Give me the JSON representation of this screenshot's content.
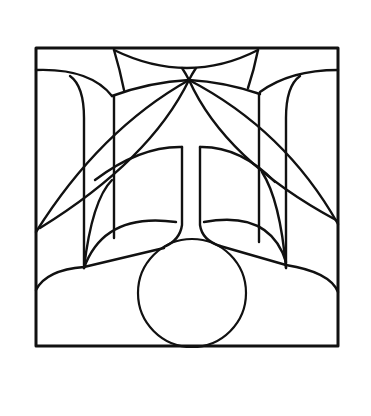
{
  "artwork": {
    "subject": "stained-glass style geometric line drawing",
    "colors": {
      "background": "#ffffff",
      "stroke": "#111111"
    },
    "frame": {
      "x": 36,
      "y": 48,
      "width": 302,
      "height": 298,
      "stroke_width": 3
    },
    "circle": {
      "cx": 192,
      "cy": 293,
      "r": 54,
      "stroke_width": 2.2
    },
    "paths": [
      {
        "name": "top-arc",
        "d": "M114 50 Q188 86 258 50"
      },
      {
        "name": "top-left-spoke",
        "d": "M114 50 Q120 70 124 90"
      },
      {
        "name": "top-right-spoke",
        "d": "M258 50 Q254 70 248 88"
      },
      {
        "name": "bowtie-left",
        "d": "M182 68 Q186 74 189 80"
      },
      {
        "name": "bowtie-right",
        "d": "M196 68 Q192 74 189 80"
      },
      {
        "name": "upper-left-ledge",
        "d": "M36 70 Q90 68 112 96"
      },
      {
        "name": "upper-left-inner",
        "d": "M70 76 Q84 86 84 118 L84 268"
      },
      {
        "name": "left-box-top",
        "d": "M112 96 Q150 82 189 80"
      },
      {
        "name": "left-box-side",
        "d": "M114 96 L114 238"
      },
      {
        "name": "upper-right-ledge",
        "d": "M338 70 Q290 70 260 92"
      },
      {
        "name": "upper-right-inner",
        "d": "M300 76 Q286 86 286 118 L286 268"
      },
      {
        "name": "right-box-top",
        "d": "M260 94 Q225 82 189 80"
      },
      {
        "name": "right-box-side",
        "d": "M259 94 L259 242"
      },
      {
        "name": "left-petal-outer",
        "d": "M189 80 Q100 130 36 232"
      },
      {
        "name": "left-petal-inner",
        "d": "M189 80 Q150 160 40 228"
      },
      {
        "name": "right-petal-outer",
        "d": "M189 80 Q285 130 338 224"
      },
      {
        "name": "right-petal-inner",
        "d": "M189 80 Q225 160 336 220"
      },
      {
        "name": "arch-left",
        "d": "M95 180 Q140 146 182 147"
      },
      {
        "name": "arch-right",
        "d": "M200 147 Q240 146 275 182"
      },
      {
        "name": "left-lower-diagonal",
        "d": "M84 268 Q92 200 112 180"
      },
      {
        "name": "right-lower-diagonal",
        "d": "M286 268 Q280 200 262 172"
      },
      {
        "name": "stem-left",
        "d": "M182 147 L182 225 Q180 240 164 247"
      },
      {
        "name": "stem-right",
        "d": "M200 147 L200 225 Q202 240 220 246"
      },
      {
        "name": "lobe-left",
        "d": "M84 268 Q104 212 176 222"
      },
      {
        "name": "lobe-right",
        "d": "M204 222 Q270 210 286 262"
      },
      {
        "name": "shoulder-left",
        "d": "M36 290 Q46 270 84 267 L164 248"
      },
      {
        "name": "shoulder-right",
        "d": "M220 246 L286 265 Q330 272 338 292"
      }
    ]
  }
}
